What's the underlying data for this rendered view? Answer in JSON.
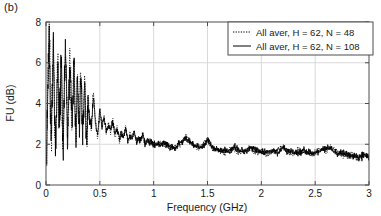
{
  "panel": {
    "label": "(b)"
  },
  "chart_data": {
    "type": "line",
    "title": "",
    "xlabel": "Frequency (GHz)",
    "ylabel": "FU (dB)",
    "xlim": [
      0,
      3
    ],
    "ylim": [
      0,
      8
    ],
    "xticks": [
      0,
      0.5,
      1,
      1.5,
      2,
      2.5,
      3
    ],
    "xtick_labels": [
      "0",
      "0.5",
      "1",
      "1.5",
      "2",
      "2.5",
      "3"
    ],
    "yticks": [
      0,
      2,
      4,
      6,
      8
    ],
    "ytick_labels": [
      "0",
      "2",
      "4",
      "6",
      "8"
    ],
    "grid": true,
    "grid_color": "#d9d9d9",
    "axis_color": "#4d4d4d",
    "legend_position": "top-right",
    "legend": [
      {
        "label": "All aver, H = 62, N = 48",
        "style": "dotted",
        "color": "#000000"
      },
      {
        "label": "All aver, H = 62, N = 108",
        "style": "solid",
        "color": "#000000"
      }
    ],
    "series": [
      {
        "name": "All aver, H = 62, N = 48",
        "style": "dotted",
        "color": "#000000",
        "description": "Dense oscillatory spectrum, very large ripples below 0.45 GHz peaking near 7.8 dB, decaying to a noisy floor near 1.5-2 dB above 1 GHz",
        "x": [
          0.0,
          0.01,
          0.02,
          0.03,
          0.04,
          0.05,
          0.06,
          0.07,
          0.08,
          0.09,
          0.1,
          0.11,
          0.12,
          0.13,
          0.14,
          0.15,
          0.16,
          0.17,
          0.18,
          0.19,
          0.2,
          0.21,
          0.22,
          0.23,
          0.24,
          0.25,
          0.26,
          0.27,
          0.28,
          0.29,
          0.3,
          0.31,
          0.32,
          0.33,
          0.34,
          0.35,
          0.36,
          0.37,
          0.38,
          0.39,
          0.4,
          0.42,
          0.44,
          0.46,
          0.48,
          0.5,
          0.52,
          0.54,
          0.56,
          0.58,
          0.6,
          0.62,
          0.64,
          0.66,
          0.68,
          0.7,
          0.72,
          0.74,
          0.76,
          0.78,
          0.8,
          0.82,
          0.84,
          0.86,
          0.88,
          0.9,
          0.92,
          0.94,
          0.96,
          0.98,
          1.0,
          1.05,
          1.1,
          1.15,
          1.2,
          1.25,
          1.3,
          1.35,
          1.4,
          1.45,
          1.5,
          1.55,
          1.6,
          1.65,
          1.7,
          1.75,
          1.8,
          1.85,
          1.9,
          1.95,
          2.0,
          2.05,
          2.1,
          2.15,
          2.2,
          2.25,
          2.3,
          2.35,
          2.4,
          2.45,
          2.5,
          2.55,
          2.6,
          2.65,
          2.7,
          2.75,
          2.8,
          2.85,
          2.9,
          2.95,
          3.0
        ],
        "y": [
          1.0,
          2.6,
          5.2,
          7.6,
          4.4,
          2.3,
          5.4,
          7.2,
          3.1,
          1.6,
          4.8,
          6.1,
          2.5,
          4.1,
          6.8,
          3.4,
          1.9,
          5.0,
          7.1,
          4.6,
          2.2,
          3.8,
          6.4,
          5.1,
          2.8,
          4.3,
          6.6,
          3.6,
          2.1,
          5.5,
          4.0,
          2.6,
          5.8,
          4.5,
          2.4,
          3.9,
          5.3,
          3.2,
          2.0,
          4.2,
          3.5,
          2.7,
          4.6,
          3.1,
          2.3,
          3.8,
          2.9,
          3.4,
          2.5,
          3.0,
          2.6,
          3.2,
          2.4,
          2.8,
          2.2,
          2.6,
          2.3,
          2.9,
          2.1,
          2.5,
          2.2,
          2.7,
          2.0,
          2.4,
          2.1,
          2.6,
          1.9,
          2.3,
          2.0,
          2.2,
          1.9,
          2.1,
          2.0,
          1.8,
          1.9,
          2.0,
          2.4,
          2.1,
          1.8,
          1.9,
          2.3,
          1.7,
          1.8,
          1.6,
          1.7,
          1.8,
          1.6,
          1.7,
          1.8,
          1.6,
          1.7,
          1.5,
          1.6,
          1.7,
          1.9,
          1.6,
          1.5,
          1.7,
          1.6,
          1.5,
          1.6,
          1.8,
          1.7,
          1.9,
          1.6,
          1.5,
          1.4,
          1.5,
          1.3,
          1.4,
          1.5
        ]
      },
      {
        "name": "All aver, H = 62, N = 108",
        "style": "solid",
        "color": "#000000",
        "description": "Same spectrum averaged over more samples; nearly overlapping the dotted trace, slightly smoother",
        "x": [
          0.0,
          0.01,
          0.02,
          0.03,
          0.04,
          0.05,
          0.06,
          0.07,
          0.08,
          0.09,
          0.1,
          0.11,
          0.12,
          0.13,
          0.14,
          0.15,
          0.16,
          0.17,
          0.18,
          0.19,
          0.2,
          0.21,
          0.22,
          0.23,
          0.24,
          0.25,
          0.26,
          0.27,
          0.28,
          0.29,
          0.3,
          0.31,
          0.32,
          0.33,
          0.34,
          0.35,
          0.36,
          0.37,
          0.38,
          0.39,
          0.4,
          0.42,
          0.44,
          0.46,
          0.48,
          0.5,
          0.52,
          0.54,
          0.56,
          0.58,
          0.6,
          0.62,
          0.64,
          0.66,
          0.68,
          0.7,
          0.72,
          0.74,
          0.76,
          0.78,
          0.8,
          0.82,
          0.84,
          0.86,
          0.88,
          0.9,
          0.92,
          0.94,
          0.96,
          0.98,
          1.0,
          1.05,
          1.1,
          1.15,
          1.2,
          1.25,
          1.3,
          1.35,
          1.4,
          1.45,
          1.5,
          1.55,
          1.6,
          1.65,
          1.7,
          1.75,
          1.8,
          1.85,
          1.9,
          1.95,
          2.0,
          2.05,
          2.1,
          2.15,
          2.2,
          2.25,
          2.3,
          2.35,
          2.4,
          2.45,
          2.5,
          2.55,
          2.6,
          2.65,
          2.7,
          2.75,
          2.8,
          2.85,
          2.9,
          2.95,
          3.0
        ],
        "y": [
          1.1,
          2.4,
          4.9,
          7.2,
          4.2,
          2.4,
          5.1,
          6.9,
          3.0,
          1.7,
          4.6,
          5.8,
          2.6,
          4.0,
          6.5,
          3.3,
          2.0,
          4.8,
          6.8,
          4.4,
          2.3,
          3.7,
          6.1,
          4.9,
          2.9,
          4.2,
          6.3,
          3.5,
          2.2,
          5.3,
          3.9,
          2.7,
          5.5,
          4.3,
          2.5,
          3.8,
          5.1,
          3.1,
          2.1,
          4.1,
          3.4,
          2.8,
          4.4,
          3.0,
          2.4,
          3.7,
          2.8,
          3.3,
          2.6,
          2.9,
          2.7,
          3.1,
          2.5,
          2.7,
          2.3,
          2.5,
          2.4,
          2.8,
          2.2,
          2.4,
          2.3,
          2.6,
          2.1,
          2.3,
          2.2,
          2.5,
          2.0,
          2.2,
          2.1,
          2.1,
          2.0,
          2.0,
          2.1,
          1.9,
          1.8,
          2.1,
          2.3,
          2.0,
          1.9,
          1.8,
          2.2,
          1.8,
          1.7,
          1.7,
          1.6,
          1.9,
          1.7,
          1.6,
          1.9,
          1.7,
          1.6,
          1.6,
          1.7,
          1.6,
          1.8,
          1.7,
          1.6,
          1.6,
          1.7,
          1.6,
          1.5,
          1.7,
          1.8,
          1.8,
          1.5,
          1.6,
          1.5,
          1.4,
          1.4,
          1.5,
          1.4
        ]
      }
    ]
  }
}
